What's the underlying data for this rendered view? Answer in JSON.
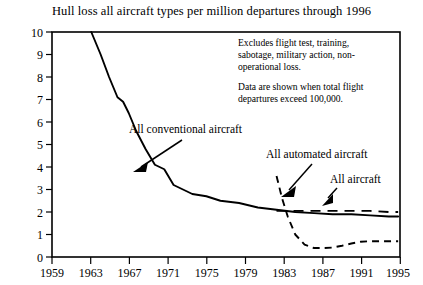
{
  "chart_data": {
    "type": "line",
    "title": "Hull loss all aircraft types per million departures through 1996",
    "xlabel": "",
    "ylabel": "",
    "xlim": [
      1959,
      1996.2
    ],
    "ylim": [
      0,
      10
    ],
    "grid": false,
    "legend_position": "inline-annotations",
    "xticks": [
      "1959",
      "1963",
      "1967",
      "1971",
      "1975",
      "1979",
      "1983",
      "1987",
      "1991",
      "1995"
    ],
    "yticks": [
      "0",
      "1",
      "2",
      "3",
      "4",
      "5",
      "6",
      "7",
      "8",
      "9",
      "10"
    ],
    "series": [
      {
        "name": "All conventional aircraft",
        "style": "solid",
        "x": [
          1963.2,
          1964.2,
          1965.1,
          1966.0,
          1966.6,
          1967.2,
          1968.0,
          1969.0,
          1970.0,
          1971.0,
          1972.0,
          1973.0,
          1974.0,
          1975.5,
          1977.0,
          1979.0,
          1981.0,
          1983.0,
          1985.0,
          1987.0,
          1989.0,
          1991.0,
          1993.0,
          1995.0,
          1996.0
        ],
        "values": [
          10.0,
          9.0,
          8.0,
          7.1,
          6.9,
          6.4,
          5.6,
          4.8,
          4.1,
          3.9,
          3.2,
          3.0,
          2.8,
          2.7,
          2.5,
          2.4,
          2.2,
          2.1,
          2.0,
          1.95,
          1.9,
          1.9,
          1.85,
          1.8,
          1.8
        ]
      },
      {
        "name": "All automated aircraft",
        "style": "dashed-short",
        "x": [
          1983.0,
          1983.6,
          1984.2,
          1985.0,
          1986.0,
          1987.0,
          1988.0,
          1989.0,
          1990.0,
          1991.0,
          1992.0,
          1993.0,
          1994.0,
          1995.0,
          1996.0
        ],
        "values": [
          3.6,
          2.6,
          1.8,
          1.0,
          0.55,
          0.4,
          0.4,
          0.42,
          0.5,
          0.6,
          0.68,
          0.7,
          0.7,
          0.7,
          0.7
        ]
      },
      {
        "name": "All aircraft",
        "style": "dashed-long",
        "x": [
          1983.0,
          1985.0,
          1987.0,
          1989.0,
          1991.0,
          1993.0,
          1995.0,
          1996.0
        ],
        "values": [
          2.05,
          2.05,
          2.05,
          2.05,
          2.05,
          2.05,
          2.0,
          2.0
        ]
      }
    ],
    "annotations": [
      {
        "id": "note-exclusions",
        "lines": [
          "Excludes flight test, training,",
          "sabotage, military action, non-",
          "operational loss."
        ]
      },
      {
        "id": "note-threshold",
        "lines": [
          "Data are shown when total flight",
          "departures exceed 100,000."
        ]
      },
      {
        "id": "label-conventional",
        "text": "All conventional aircraft"
      },
      {
        "id": "label-automated",
        "text": "All automated aircraft"
      },
      {
        "id": "label-all",
        "text": "All aircraft"
      }
    ]
  }
}
